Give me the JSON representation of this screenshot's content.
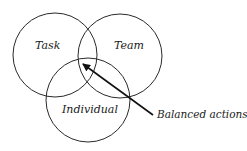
{
  "diagram": {
    "type": "venn",
    "sets": [
      {
        "label": "Task",
        "cx": 55,
        "cy": 55,
        "r": 42
      },
      {
        "label": "Team",
        "cx": 120,
        "cy": 56,
        "r": 42
      },
      {
        "label": "Individual",
        "cx": 88,
        "cy": 100,
        "r": 42
      }
    ],
    "annotation": {
      "label": "Balanced actions",
      "arrow_from": [
        153,
        115
      ],
      "arrow_to": [
        82,
        63
      ]
    },
    "colors": {
      "stroke": "#2a2a2a",
      "text": "#1a1a1a",
      "background": "#ffffff"
    }
  }
}
